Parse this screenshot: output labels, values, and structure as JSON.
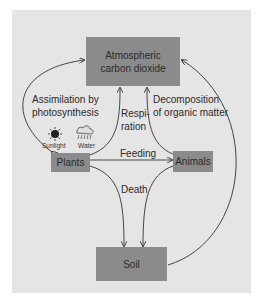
{
  "diagram": {
    "nodes": {
      "atmosphere": {
        "line1": "Atmospheric",
        "line2": "carbon dioxide"
      },
      "plants": "Plants",
      "animals": "Animals",
      "soil": "Soil"
    },
    "edges": {
      "assimilation": {
        "line1": "Assimilation by",
        "line2": "photosynthesis"
      },
      "respiration": {
        "line1": "Respi-",
        "line2": "ration"
      },
      "decomposition": {
        "line1": "Decomposition",
        "line2": "of organic matter"
      },
      "feeding": "Feeding",
      "death": "Death"
    },
    "icons": {
      "sunlight": "Sunlight",
      "water": "Water"
    },
    "colors": {
      "panel": "#e5e5e5",
      "box": "#8b8b8b",
      "line": "#333333"
    }
  }
}
